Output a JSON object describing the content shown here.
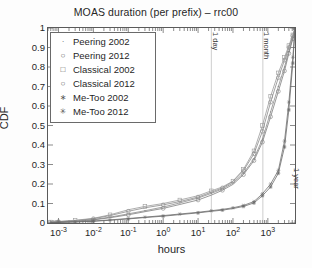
{
  "chart_data": {
    "type": "line",
    "title": "MOAS duration (per prefix) – rrc00",
    "xlabel": "hours",
    "ylabel": "CDF",
    "xscale": "log",
    "xlim": [
      0.0005,
      6000
    ],
    "ylim": [
      0,
      1
    ],
    "grid": false,
    "legend_position": "upper-left",
    "xticks": [
      {
        "value": 0.001,
        "label": "10",
        "exp": "-3"
      },
      {
        "value": 0.01,
        "label": "10",
        "exp": "-2"
      },
      {
        "value": 0.1,
        "label": "10",
        "exp": "-1"
      },
      {
        "value": 1,
        "label": "10",
        "exp": "0"
      },
      {
        "value": 10,
        "label": "10",
        "exp": "1"
      },
      {
        "value": 100,
        "label": "10",
        "exp": "2"
      },
      {
        "value": 1000,
        "label": "10",
        "exp": "3"
      }
    ],
    "yticks": [
      {
        "value": 0,
        "label": "0"
      },
      {
        "value": 0.1,
        "label": "0.1"
      },
      {
        "value": 0.2,
        "label": "0.2"
      },
      {
        "value": 0.3,
        "label": "0.3"
      },
      {
        "value": 0.4,
        "label": "0.4"
      },
      {
        "value": 0.5,
        "label": "0.5"
      },
      {
        "value": 0.6,
        "label": "0.6"
      },
      {
        "value": 0.7,
        "label": "0.7"
      },
      {
        "value": 0.8,
        "label": "0.8"
      },
      {
        "value": 0.9,
        "label": "0.9"
      },
      {
        "value": 1,
        "label": "1"
      }
    ],
    "annotations": [
      {
        "label": "1 day",
        "x": 24,
        "orientation": "vertical",
        "line": true
      },
      {
        "label": "1 month",
        "x": 720,
        "orientation": "vertical",
        "line": true
      },
      {
        "label": "1 year",
        "x": 5200,
        "orientation": "vertical",
        "line": false
      }
    ],
    "series": [
      {
        "name": "Peering 2002",
        "marker": "dot",
        "color": "#8c8c8c",
        "points": [
          [
            0.0006,
            0.004
          ],
          [
            0.001,
            0.006
          ],
          [
            0.003,
            0.01
          ],
          [
            0.01,
            0.018
          ],
          [
            0.03,
            0.03
          ],
          [
            0.1,
            0.047
          ],
          [
            0.3,
            0.063
          ],
          [
            1,
            0.082
          ],
          [
            3,
            0.103
          ],
          [
            10,
            0.128
          ],
          [
            24,
            0.152
          ],
          [
            50,
            0.175
          ],
          [
            100,
            0.205
          ],
          [
            200,
            0.255
          ],
          [
            400,
            0.33
          ],
          [
            700,
            0.43
          ],
          [
            1200,
            0.57
          ],
          [
            2000,
            0.7
          ],
          [
            3000,
            0.8
          ],
          [
            4000,
            0.88
          ],
          [
            5200,
            0.95
          ],
          [
            6000,
            1.0
          ]
        ]
      },
      {
        "name": "Peering 2012",
        "marker": "circle",
        "color": "#7f7f7f",
        "points": [
          [
            0.0006,
            0.003
          ],
          [
            0.001,
            0.005
          ],
          [
            0.003,
            0.009
          ],
          [
            0.01,
            0.016
          ],
          [
            0.03,
            0.027
          ],
          [
            0.1,
            0.042
          ],
          [
            0.3,
            0.058
          ],
          [
            1,
            0.075
          ],
          [
            3,
            0.095
          ],
          [
            10,
            0.118
          ],
          [
            24,
            0.143
          ],
          [
            50,
            0.168
          ],
          [
            100,
            0.198
          ],
          [
            200,
            0.248
          ],
          [
            400,
            0.32
          ],
          [
            700,
            0.415
          ],
          [
            1200,
            0.545
          ],
          [
            2000,
            0.675
          ],
          [
            3000,
            0.78
          ],
          [
            4000,
            0.87
          ],
          [
            5200,
            0.945
          ],
          [
            6000,
            1.0
          ]
        ]
      },
      {
        "name": "Classical 2002",
        "marker": "square",
        "color": "#9a9a9a",
        "points": [
          [
            0.0006,
            0.005
          ],
          [
            0.001,
            0.008
          ],
          [
            0.003,
            0.014
          ],
          [
            0.01,
            0.024
          ],
          [
            0.03,
            0.042
          ],
          [
            0.1,
            0.068
          ],
          [
            0.3,
            0.085
          ],
          [
            1,
            0.1
          ],
          [
            3,
            0.118
          ],
          [
            10,
            0.14
          ],
          [
            24,
            0.165
          ],
          [
            50,
            0.185
          ],
          [
            100,
            0.215
          ],
          [
            200,
            0.275
          ],
          [
            400,
            0.37
          ],
          [
            700,
            0.5
          ],
          [
            1200,
            0.65
          ],
          [
            2000,
            0.77
          ],
          [
            3000,
            0.85
          ],
          [
            4000,
            0.91
          ],
          [
            5200,
            0.965
          ],
          [
            6000,
            1.0
          ]
        ]
      },
      {
        "name": "Classical 2012",
        "marker": "circle-open",
        "color": "#8a8a8a",
        "points": [
          [
            0.0006,
            0.004
          ],
          [
            0.001,
            0.007
          ],
          [
            0.003,
            0.012
          ],
          [
            0.01,
            0.022
          ],
          [
            0.03,
            0.038
          ],
          [
            0.1,
            0.06
          ],
          [
            0.3,
            0.078
          ],
          [
            1,
            0.093
          ],
          [
            3,
            0.11
          ],
          [
            10,
            0.133
          ],
          [
            24,
            0.158
          ],
          [
            50,
            0.18
          ],
          [
            100,
            0.212
          ],
          [
            200,
            0.268
          ],
          [
            400,
            0.355
          ],
          [
            700,
            0.47
          ],
          [
            1200,
            0.62
          ],
          [
            2000,
            0.745
          ],
          [
            3000,
            0.835
          ],
          [
            4000,
            0.9
          ],
          [
            5200,
            0.96
          ],
          [
            6000,
            1.0
          ]
        ]
      },
      {
        "name": "Me-Too 2002",
        "marker": "asterisk",
        "color": "#707070",
        "points": [
          [
            0.0006,
            0.002
          ],
          [
            0.001,
            0.003
          ],
          [
            0.003,
            0.006
          ],
          [
            0.01,
            0.01
          ],
          [
            0.03,
            0.016
          ],
          [
            0.1,
            0.023
          ],
          [
            0.3,
            0.03
          ],
          [
            1,
            0.038
          ],
          [
            3,
            0.046
          ],
          [
            10,
            0.055
          ],
          [
            24,
            0.063
          ],
          [
            50,
            0.07
          ],
          [
            100,
            0.078
          ],
          [
            200,
            0.09
          ],
          [
            400,
            0.11
          ],
          [
            700,
            0.15
          ],
          [
            1200,
            0.2
          ],
          [
            2000,
            0.27
          ],
          [
            3000,
            0.42
          ],
          [
            4000,
            0.62
          ],
          [
            5200,
            0.85
          ],
          [
            6000,
            1.0
          ]
        ]
      },
      {
        "name": "Me-Too 2012",
        "marker": "star",
        "color": "#6b6b6b",
        "points": [
          [
            0.0006,
            0.002
          ],
          [
            0.001,
            0.003
          ],
          [
            0.003,
            0.005
          ],
          [
            0.01,
            0.009
          ],
          [
            0.03,
            0.014
          ],
          [
            0.1,
            0.021
          ],
          [
            0.3,
            0.028
          ],
          [
            1,
            0.035
          ],
          [
            3,
            0.043
          ],
          [
            10,
            0.052
          ],
          [
            24,
            0.06
          ],
          [
            50,
            0.066
          ],
          [
            100,
            0.074
          ],
          [
            200,
            0.085
          ],
          [
            400,
            0.103
          ],
          [
            700,
            0.14
          ],
          [
            1200,
            0.185
          ],
          [
            2000,
            0.255
          ],
          [
            3000,
            0.39
          ],
          [
            4000,
            0.58
          ],
          [
            5200,
            0.82
          ],
          [
            6000,
            1.0
          ]
        ]
      }
    ]
  },
  "legend": {
    "items": [
      {
        "label": "Peering 2002",
        "marker": "dot"
      },
      {
        "label": "Peering 2012",
        "marker": "circle"
      },
      {
        "label": "Classical 2002",
        "marker": "square"
      },
      {
        "label": "Classical 2012",
        "marker": "circle-open"
      },
      {
        "label": "Me-Too 2002",
        "marker": "asterisk"
      },
      {
        "label": "Me-Too 2012",
        "marker": "star"
      }
    ]
  }
}
